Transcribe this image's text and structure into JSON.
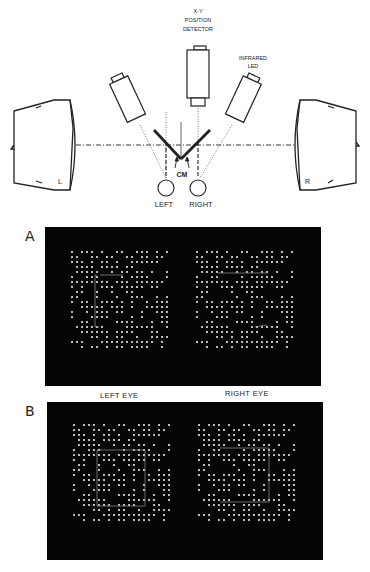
{
  "diagram": {
    "labels": {
      "detector_line1": "X-Y",
      "detector_line2": "POSITION",
      "detector_line3": "DETECTOR",
      "led_line1": "INFRARED",
      "led_line2": "LED",
      "cm": "CM",
      "left_eye": "LEFT",
      "right_eye": "RIGHT",
      "left_monitor": "L",
      "right_monitor": "R"
    }
  },
  "panels": {
    "a": {
      "letter": "A"
    },
    "b": {
      "letter": "B"
    }
  },
  "eye_labels": {
    "left": "LEFT EYE",
    "right": "RIGHT EYE"
  },
  "colors": {
    "panel_bg": "#050505",
    "dot": "#e8e8e8",
    "outline": "#9a9a9a",
    "ink": "#222222"
  },
  "stereogram": {
    "cols": 20,
    "rows": 20,
    "spacing": 5,
    "seed": 7
  }
}
